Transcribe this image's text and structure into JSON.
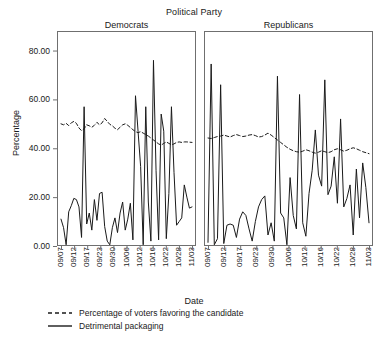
{
  "chart": {
    "super_title": "Political Party",
    "xlabel": "Date",
    "ylabel": "Percentage",
    "panels": [
      {
        "id": "democrats",
        "label": "Democrats"
      },
      {
        "id": "republicans",
        "label": "Republicans"
      }
    ],
    "ytick_labels": [
      "80.00",
      "60.00",
      "40.00",
      "20.00",
      "0.00"
    ],
    "xtick_labels": [
      "09/07",
      "09/12",
      "09/17",
      "09/23",
      "09/30",
      "10/06",
      "10/12",
      "10/16",
      "10/22",
      "10/28",
      "11/03"
    ],
    "legend": [
      {
        "id": "poll",
        "label": "Percentage of voters favoring the candidate",
        "style": "dashed"
      },
      {
        "id": "packaging",
        "label": "Detrimental packaging",
        "style": "solid"
      }
    ],
    "colors": {
      "line": "#1a1a1a",
      "axis": "#6f6f6f",
      "background": "#ffffff"
    }
  },
  "chart_data": {
    "type": "line",
    "title": "Political Party",
    "xlabel": "Date",
    "ylabel": "Percentage",
    "ylim": [
      0,
      88
    ],
    "yticks": [
      0,
      20,
      40,
      60,
      80
    ],
    "grid": false,
    "legend_position": "bottom-left",
    "panels": [
      {
        "name": "Democrats",
        "x_tick_labels": [
          "09/07",
          "09/12",
          "09/17",
          "09/23",
          "09/30",
          "10/06",
          "10/12",
          "10/16",
          "10/22",
          "10/28",
          "11/03"
        ],
        "series": [
          {
            "name": "Percentage of voters favoring the candidate",
            "style": "dashed",
            "values": [
              50.0,
              49.6,
              50.2,
              49.3,
              50.4,
              51.0,
              50.2,
              48.3,
              47.2,
              48.0,
              49.6,
              49.2,
              48.6,
              49.4,
              50.6,
              49.6,
              50.4,
              52.2,
              51.0,
              49.8,
              49.2,
              48.2,
              47.6,
              48.6,
              49.6,
              50.0,
              49.4,
              48.5,
              47.6,
              46.8,
              46.4,
              46.8,
              46.2,
              45.6,
              45.0,
              44.2,
              43.4,
              42.6,
              41.8,
              41.3,
              42.0,
              42.6,
              42.0,
              41.4,
              41.8,
              42.4,
              42.6,
              42.4,
              42.6,
              42.6,
              42.5,
              42.4
            ]
          },
          {
            "name": "Detrimental packaging",
            "style": "solid",
            "values": [
              11.0,
              7.5,
              0.5,
              14.0,
              16.5,
              19.5,
              19.0,
              16.0,
              3.5,
              57.0,
              9.0,
              13.5,
              6.5,
              19.0,
              10.5,
              21.5,
              22.0,
              8.0,
              2.0,
              0.5,
              7.5,
              11.5,
              5.5,
              13.5,
              18.0,
              6.5,
              11.0,
              17.5,
              2.5,
              61.5,
              47.0,
              32.5,
              0.5,
              57.0,
              18.0,
              2.0,
              76.0,
              31.0,
              2.5,
              54.0,
              47.0,
              3.0,
              21.5,
              57.0,
              30.0,
              8.5,
              10.0,
              11.5,
              25.0,
              20.0,
              15.5,
              16.0
            ]
          }
        ]
      },
      {
        "name": "Republicans",
        "x_tick_labels": [
          "09/07",
          "09/12",
          "09/17",
          "09/23",
          "09/30",
          "10/06",
          "10/12",
          "10/16",
          "10/22",
          "10/28",
          "11/03"
        ],
        "series": [
          {
            "name": "Percentage of voters favoring the candidate",
            "style": "dashed",
            "values": [
              44.2,
              44.0,
              44.4,
              44.8,
              45.0,
              45.4,
              45.0,
              44.6,
              45.2,
              45.6,
              45.2,
              44.8,
              45.0,
              45.4,
              45.6,
              45.2,
              44.6,
              44.8,
              45.4,
              46.2,
              45.4,
              44.4,
              43.4,
              42.4,
              41.4,
              40.4,
              39.6,
              39.0,
              38.6,
              38.4,
              38.8,
              39.4,
              39.0,
              38.4,
              38.0,
              38.4,
              39.0,
              38.6,
              38.2,
              38.6,
              39.4,
              39.8,
              39.4,
              38.8,
              39.2,
              39.8,
              40.2,
              39.8,
              39.2,
              38.6,
              38.2,
              37.8
            ]
          },
          {
            "name": "Detrimental packaging",
            "style": "solid",
            "values": [
              1.5,
              74.5,
              0.5,
              3.0,
              66.0,
              1.0,
              8.5,
              9.0,
              8.5,
              3.5,
              11.0,
              14.0,
              12.5,
              7.0,
              2.0,
              10.0,
              16.0,
              19.0,
              20.5,
              4.5,
              9.5,
              2.0,
              69.5,
              13.5,
              11.5,
              0.5,
              28.0,
              12.5,
              7.0,
              62.0,
              9.5,
              4.0,
              21.5,
              31.0,
              47.5,
              29.0,
              24.5,
              68.0,
              21.0,
              24.5,
              36.5,
              17.5,
              52.0,
              16.0,
              19.5,
              25.0,
              4.5,
              31.5,
              11.5,
              34.0,
              24.0,
              9.5
            ]
          }
        ]
      }
    ]
  }
}
